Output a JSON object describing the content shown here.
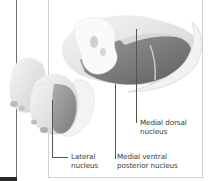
{
  "figure": {
    "labels": {
      "medial_dorsal": {
        "line1": "Medial dorsal",
        "line2": "nucleus"
      },
      "lateral": {
        "line1": "Lateral",
        "line2": "nucleus"
      },
      "medial_ventral_posterior": {
        "line1": "Medial ventral",
        "line2": "posterior nucleus"
      }
    },
    "colors": {
      "panel_border": "#d2d2d2",
      "left_rule": "#6e6e6e",
      "label_text": "#3a3a3a",
      "structure_light": "#ebebeb",
      "structure_mid": "#a8a8a8",
      "structure_dark": "#6a6a6a"
    }
  }
}
